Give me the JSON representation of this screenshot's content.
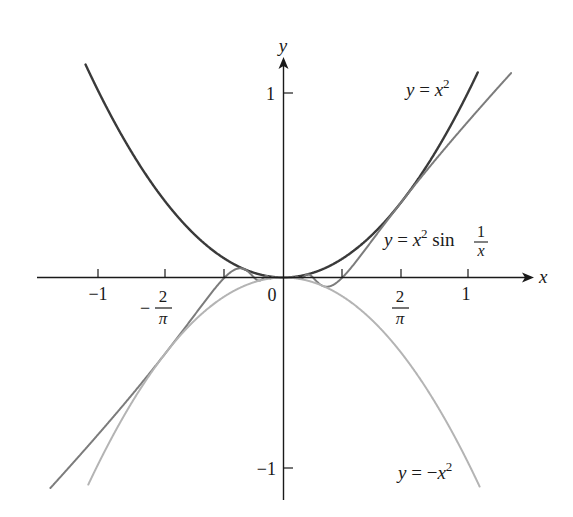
{
  "chart_data": {
    "type": "line",
    "title": "",
    "xlabel": "x",
    "ylabel": "y",
    "xlim": [
      -1.4,
      1.35
    ],
    "ylim": [
      -1.2,
      1.2
    ],
    "grid": false,
    "legend": "inline labels near curves",
    "x_ticks": [
      {
        "value": -1,
        "label": "-1"
      },
      {
        "value": -0.6366,
        "label_num": "2",
        "label_den": "π",
        "sign": "−"
      },
      {
        "value": -0.3183,
        "label": ""
      },
      {
        "value": 0.3183,
        "label": ""
      },
      {
        "value": 0.6366,
        "label_num": "2",
        "label_den": "π",
        "sign": ""
      },
      {
        "value": 1,
        "label": "1"
      }
    ],
    "y_ticks": [
      {
        "value": 1,
        "label": "1"
      },
      {
        "value": -1,
        "label": "−1"
      }
    ],
    "origin_label": "0",
    "series": [
      {
        "name": "y = x²",
        "expr": "x^2",
        "domain": [
          -1.07,
          1.05
        ],
        "color": "#3a3a3a",
        "width": 2.4
      },
      {
        "name": "y = x² sin(1/x)",
        "expr": "x^2*sin(1/x)",
        "domain": [
          -1.26,
          1.23
        ],
        "color": "#7c7c7c",
        "width": 2.0
      },
      {
        "name": "y = −x²",
        "expr": "-x^2",
        "domain": [
          -1.055,
          1.06
        ],
        "color": "#b4b4b4",
        "width": 2.0
      }
    ],
    "annotations": [
      {
        "text": "y = x²",
        "x": 0.66,
        "y": 0.98
      },
      {
        "text": "y = x² sin 1/x",
        "x": 0.54,
        "y": 0.18
      },
      {
        "text": "y = −x²",
        "x": 0.61,
        "y": -1.08
      }
    ]
  },
  "labels": {
    "x_axis": "x",
    "y_axis": "y",
    "origin": "0",
    "x_neg1": "−1",
    "x_pos1": "1",
    "y_pos1": "1",
    "y_neg1": "−1",
    "two": "2",
    "pi": "π",
    "minus": "−",
    "curve1_y": "y",
    "curve1_eq": " = ",
    "curve1_x": "x",
    "curve1_exp": "2",
    "curve2_y": "y",
    "curve2_eq": " = ",
    "curve2_x": "x",
    "curve2_exp": "2",
    "curve2_sin": " sin ",
    "curve2_num": "1",
    "curve2_den": "x",
    "curve3_y": "y",
    "curve3_eq": " = −",
    "curve3_x": "x",
    "curve3_exp": "2"
  }
}
